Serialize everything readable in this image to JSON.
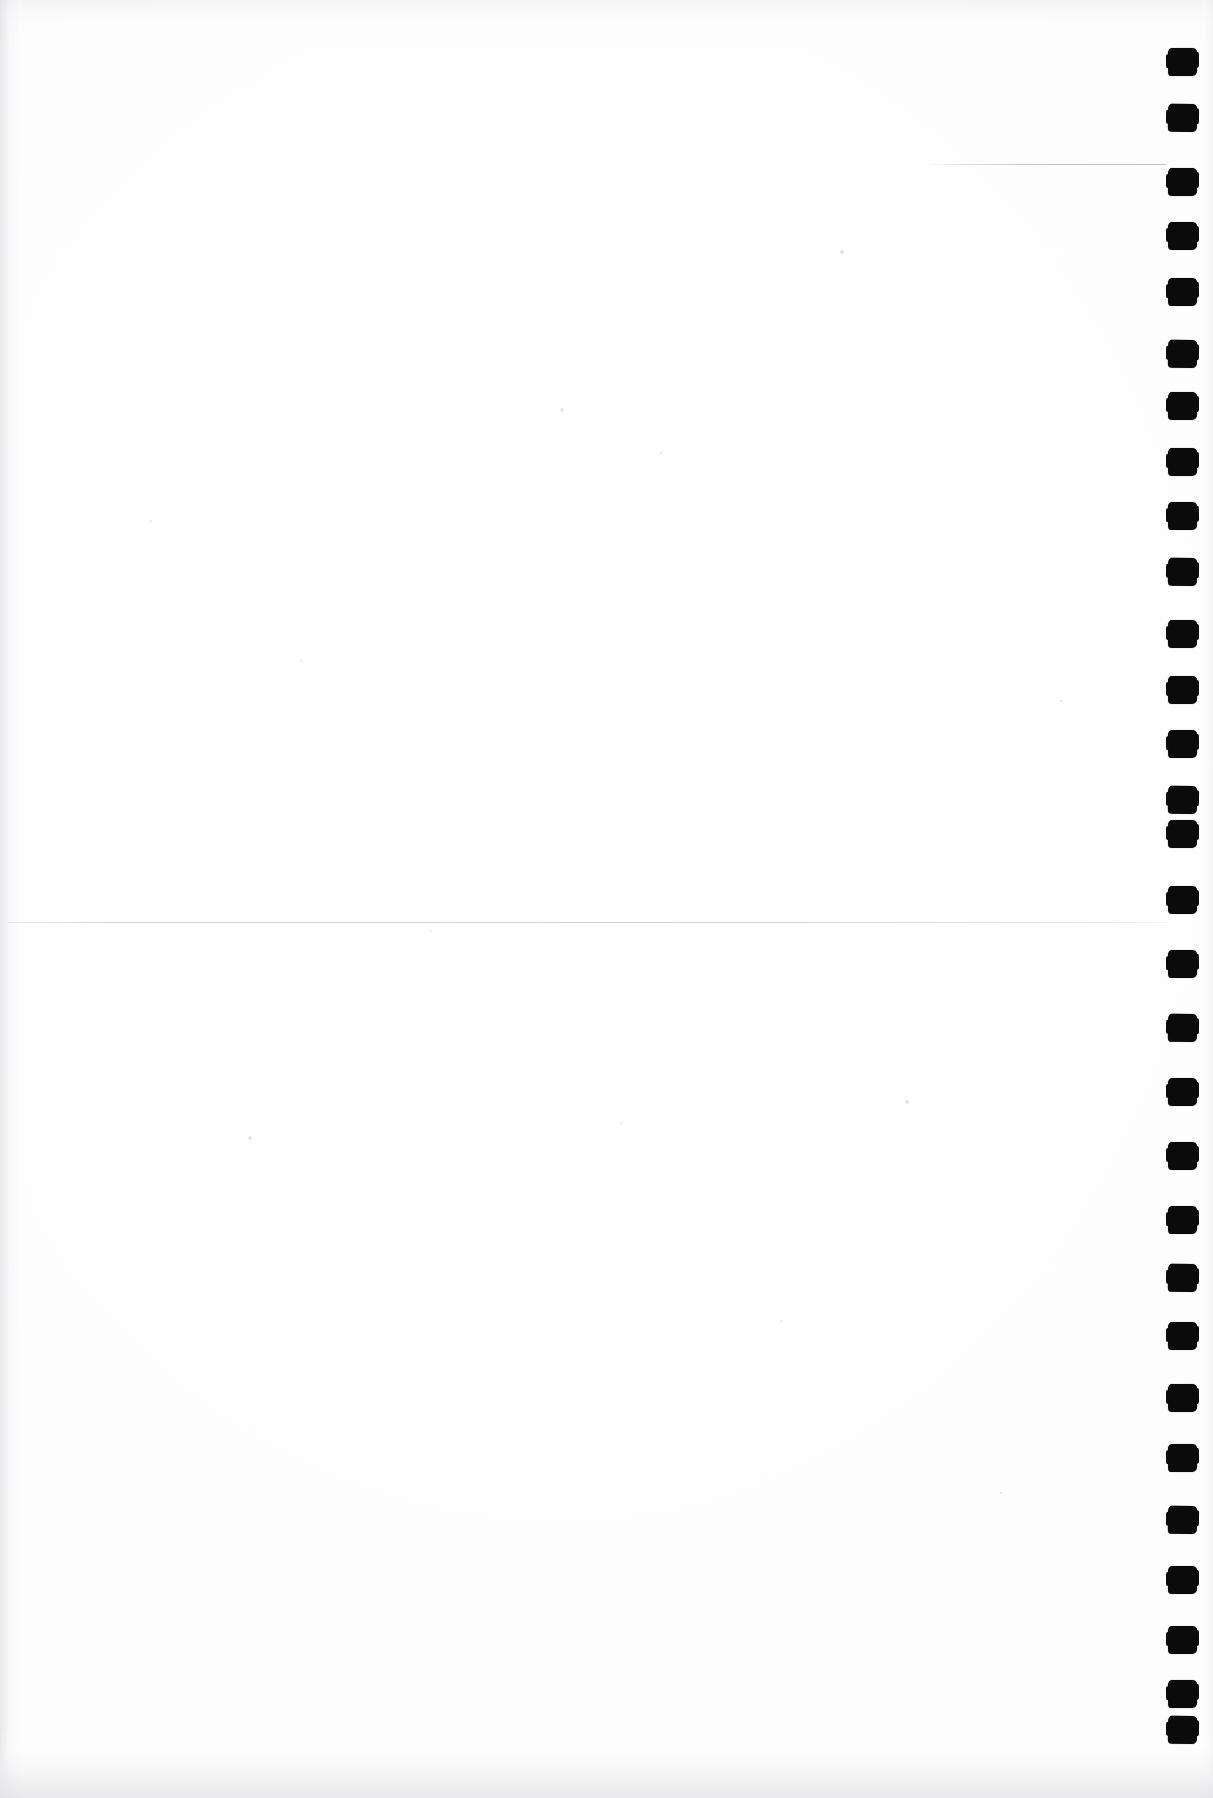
{
  "document": {
    "page_label": "",
    "body_text": "",
    "description": "Blank scanned page",
    "background_color": "#ffffff",
    "ink_color": "#0b0b0b",
    "rule_color": "#c4c4c9",
    "page_width": 1213,
    "page_height": 1798
  },
  "rules": [
    {
      "name": "upper-right-rule",
      "x": 928,
      "y": 164,
      "width": 238
    },
    {
      "name": "mid-page-rule",
      "x": 8,
      "y": 922,
      "width": 1160
    }
  ],
  "sprocket_marks": {
    "label": "",
    "count": 27,
    "color": "#0b0b0b",
    "positions": [
      48,
      104,
      168,
      222,
      278,
      340,
      392,
      448,
      502,
      558,
      620,
      676,
      730,
      786,
      820,
      886,
      950,
      1014,
      1078,
      1142,
      1206,
      1264,
      1322,
      1384,
      1444,
      1506,
      1566,
      1626,
      1680,
      1716
    ]
  },
  "specks": [
    {
      "x": 560,
      "y": 408,
      "r": 2
    },
    {
      "x": 660,
      "y": 452,
      "r": 1
    },
    {
      "x": 840,
      "y": 250,
      "r": 2
    },
    {
      "x": 300,
      "y": 660,
      "r": 1
    },
    {
      "x": 905,
      "y": 1100,
      "r": 2
    },
    {
      "x": 248,
      "y": 1136,
      "r": 2
    },
    {
      "x": 620,
      "y": 1122,
      "r": 1
    },
    {
      "x": 1000,
      "y": 1492,
      "r": 1
    },
    {
      "x": 430,
      "y": 930,
      "r": 1
    },
    {
      "x": 780,
      "y": 1320,
      "r": 1
    },
    {
      "x": 150,
      "y": 520,
      "r": 1
    },
    {
      "x": 1060,
      "y": 700,
      "r": 1
    }
  ]
}
